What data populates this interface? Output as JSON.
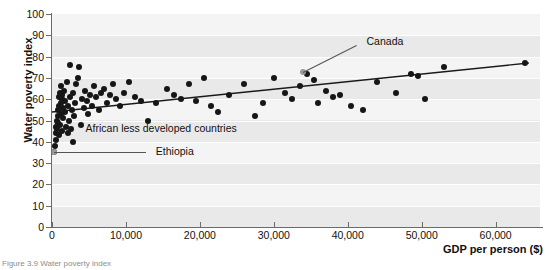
{
  "figure": {
    "caption": "Figure 3.9 Water poverty index"
  },
  "chart_data": {
    "type": "scatter",
    "title": "",
    "xlabel": "GDP per person ($)",
    "ylabel": "Water poverty index",
    "xlim": [
      0,
      66000
    ],
    "ylim": [
      0,
      100
    ],
    "grid": true,
    "legend": "none",
    "xticks": [
      0,
      10000,
      20000,
      30000,
      40000,
      50000,
      60000
    ],
    "xticklabels": [
      "0",
      "10,000",
      "20,000",
      "30,000",
      "40,000",
      "50,000",
      "60,000"
    ],
    "yticks": [
      0,
      10,
      20,
      30,
      40,
      50,
      60,
      70,
      80,
      90,
      100
    ],
    "yticklabels": [
      "0",
      "10",
      "20",
      "30",
      "40",
      "50",
      "60",
      "70",
      "80",
      "90",
      "100"
    ],
    "series": [
      {
        "name": "Countries",
        "marker": "circle",
        "color": "#161616",
        "points": [
          [
            300,
            35
          ],
          [
            400,
            38
          ],
          [
            500,
            44
          ],
          [
            550,
            47
          ],
          [
            600,
            41
          ],
          [
            650,
            50
          ],
          [
            700,
            46
          ],
          [
            750,
            55
          ],
          [
            800,
            52
          ],
          [
            850,
            49
          ],
          [
            900,
            57
          ],
          [
            950,
            61
          ],
          [
            1000,
            43
          ],
          [
            1050,
            63
          ],
          [
            1100,
            48
          ],
          [
            1150,
            58
          ],
          [
            1200,
            66
          ],
          [
            1250,
            53
          ],
          [
            1300,
            45
          ],
          [
            1350,
            60
          ],
          [
            1400,
            62
          ],
          [
            1450,
            51
          ],
          [
            1500,
            56
          ],
          [
            1600,
            64
          ],
          [
            1700,
            54
          ],
          [
            1800,
            59
          ],
          [
            1900,
            47
          ],
          [
            2000,
            68
          ],
          [
            2100,
            57
          ],
          [
            2200,
            44
          ],
          [
            2300,
            50
          ],
          [
            2400,
            61
          ],
          [
            2500,
            76
          ],
          [
            2600,
            46
          ],
          [
            2700,
            55
          ],
          [
            2800,
            63
          ],
          [
            2900,
            40
          ],
          [
            3000,
            52
          ],
          [
            3100,
            58
          ],
          [
            3300,
            67
          ],
          [
            3500,
            70
          ],
          [
            3700,
            75
          ],
          [
            3900,
            48
          ],
          [
            4100,
            60
          ],
          [
            4300,
            56
          ],
          [
            4500,
            64
          ],
          [
            4700,
            59
          ],
          [
            4900,
            53
          ],
          [
            5100,
            62
          ],
          [
            5400,
            57
          ],
          [
            5700,
            66
          ],
          [
            6000,
            61
          ],
          [
            6300,
            55
          ],
          [
            6600,
            63
          ],
          [
            7000,
            65
          ],
          [
            7400,
            58
          ],
          [
            7800,
            62
          ],
          [
            8200,
            67
          ],
          [
            8700,
            60
          ],
          [
            9200,
            57
          ],
          [
            9800,
            63
          ],
          [
            10400,
            68
          ],
          [
            11200,
            61
          ],
          [
            12000,
            59
          ],
          [
            13000,
            50
          ],
          [
            14000,
            58
          ],
          [
            15500,
            65
          ],
          [
            16500,
            62
          ],
          [
            17500,
            60
          ],
          [
            18500,
            67
          ],
          [
            19500,
            59
          ],
          [
            20500,
            70
          ],
          [
            21500,
            57
          ],
          [
            22500,
            54
          ],
          [
            24000,
            62
          ],
          [
            26000,
            67
          ],
          [
            27500,
            52
          ],
          [
            28500,
            58
          ],
          [
            30000,
            70
          ],
          [
            31500,
            63
          ],
          [
            32500,
            60
          ],
          [
            33500,
            66
          ],
          [
            34500,
            72
          ],
          [
            35500,
            69
          ],
          [
            36000,
            58
          ],
          [
            37000,
            64
          ],
          [
            38000,
            61
          ],
          [
            39000,
            62
          ],
          [
            40500,
            57
          ],
          [
            42000,
            55
          ],
          [
            44000,
            68
          ],
          [
            46500,
            63
          ],
          [
            48500,
            72
          ],
          [
            49500,
            71
          ],
          [
            50500,
            60
          ],
          [
            53000,
            75
          ],
          [
            64000,
            77
          ]
        ]
      },
      {
        "name": "Highlighted",
        "marker": "circle",
        "color": "#9a9a9a",
        "points": [
          [
            300,
            35
          ],
          [
            34000,
            73
          ]
        ]
      }
    ],
    "trendline": {
      "type": "linear",
      "color": "#1a1a1a",
      "start": [
        0,
        54
      ],
      "end": [
        64500,
        77
      ]
    },
    "annotations": [
      {
        "text": "Canada",
        "x": 34000,
        "y": 73,
        "label_x": 42000,
        "label_y": 87
      },
      {
        "text": "African less developed countries",
        "x": 3000,
        "y": 46,
        "label_x": 4000,
        "label_y": 46
      },
      {
        "text": "Ethiopia",
        "x": 300,
        "y": 35,
        "label_x": 13500,
        "label_y": 35
      }
    ]
  }
}
